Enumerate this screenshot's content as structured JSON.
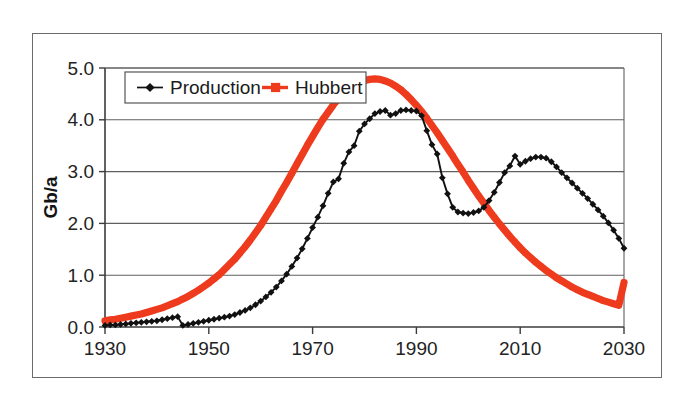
{
  "figure": {
    "has_outer_frame": true,
    "frame_color": "#6b6b6b",
    "background": "#ffffff"
  },
  "chart_data": {
    "type": "line",
    "title": "",
    "subtitle": "",
    "xlabel": "",
    "ylabel": "Gb/a",
    "xlim": [
      1930,
      2030
    ],
    "ylim": [
      0.0,
      5.0
    ],
    "xticks": [
      1930,
      1950,
      1970,
      1990,
      2010,
      2030
    ],
    "xtick_labels": [
      "1930",
      "1950",
      "1970",
      "1990",
      "2010",
      "2030"
    ],
    "yticks": [
      0.0,
      1.0,
      2.0,
      3.0,
      4.0,
      5.0
    ],
    "ytick_labels": [
      "0.0",
      "1.0",
      "2.0",
      "3.0",
      "4.0",
      "5.0"
    ],
    "grid": "horizontal",
    "legend_position": "top-left-inside",
    "x": [
      1930,
      1931,
      1932,
      1933,
      1934,
      1935,
      1936,
      1937,
      1938,
      1939,
      1940,
      1941,
      1942,
      1943,
      1944,
      1945,
      1946,
      1947,
      1948,
      1949,
      1950,
      1951,
      1952,
      1953,
      1954,
      1955,
      1956,
      1957,
      1958,
      1959,
      1960,
      1961,
      1962,
      1963,
      1964,
      1965,
      1966,
      1967,
      1968,
      1969,
      1970,
      1971,
      1972,
      1973,
      1974,
      1975,
      1976,
      1977,
      1978,
      1979,
      1980,
      1981,
      1982,
      1983,
      1984,
      1985,
      1986,
      1987,
      1988,
      1989,
      1990,
      1991,
      1992,
      1993,
      1994,
      1995,
      1996,
      1997,
      1998,
      1999,
      2000,
      2001,
      2002,
      2003,
      2004,
      2005,
      2006,
      2007,
      2008,
      2009,
      2010,
      2011,
      2012,
      2013,
      2014,
      2015,
      2016,
      2017,
      2018,
      2019,
      2020,
      2021,
      2022,
      2023,
      2024,
      2025,
      2026,
      2027,
      2028,
      2029,
      2030
    ],
    "series": [
      {
        "name": "Production",
        "color": "#111111",
        "marker": "diamond",
        "marker_size": 3.4,
        "line_width": 1.9,
        "values": [
          0.03,
          0.04,
          0.04,
          0.05,
          0.06,
          0.07,
          0.08,
          0.09,
          0.1,
          0.11,
          0.12,
          0.14,
          0.16,
          0.18,
          0.2,
          0.03,
          0.05,
          0.07,
          0.09,
          0.11,
          0.13,
          0.15,
          0.17,
          0.19,
          0.21,
          0.24,
          0.28,
          0.32,
          0.37,
          0.43,
          0.5,
          0.58,
          0.67,
          0.77,
          0.89,
          1.02,
          1.17,
          1.33,
          1.51,
          1.71,
          1.92,
          2.12,
          2.34,
          2.58,
          2.8,
          2.86,
          3.16,
          3.38,
          3.5,
          3.78,
          3.92,
          4.02,
          4.12,
          4.16,
          4.18,
          4.09,
          4.12,
          4.18,
          4.19,
          4.18,
          4.17,
          4.08,
          3.79,
          3.52,
          3.34,
          2.88,
          2.57,
          2.31,
          2.22,
          2.2,
          2.19,
          2.21,
          2.24,
          2.31,
          2.44,
          2.6,
          2.79,
          2.98,
          3.11,
          3.3,
          3.14,
          3.2,
          3.25,
          3.28,
          3.28,
          3.26,
          3.19,
          3.09,
          2.98,
          2.88,
          2.78,
          2.68,
          2.58,
          2.48,
          2.37,
          2.26,
          2.14,
          2.01,
          1.87,
          1.71,
          1.52
        ]
      },
      {
        "name": "Hubbert",
        "color": "#ee3b1e",
        "marker": "square",
        "marker_size": 5.2,
        "line_width": 7.2,
        "values": [
          0.12,
          0.14,
          0.15,
          0.17,
          0.19,
          0.21,
          0.23,
          0.25,
          0.28,
          0.31,
          0.34,
          0.37,
          0.41,
          0.45,
          0.49,
          0.54,
          0.59,
          0.65,
          0.71,
          0.78,
          0.85,
          0.93,
          1.01,
          1.11,
          1.21,
          1.31,
          1.43,
          1.55,
          1.68,
          1.82,
          1.96,
          2.12,
          2.28,
          2.44,
          2.62,
          2.79,
          2.97,
          3.15,
          3.33,
          3.51,
          3.68,
          3.85,
          4.01,
          4.15,
          4.29,
          4.41,
          4.51,
          4.6,
          4.67,
          4.73,
          4.76,
          4.78,
          4.79,
          4.78,
          4.75,
          4.71,
          4.65,
          4.58,
          4.49,
          4.39,
          4.28,
          4.16,
          4.03,
          3.89,
          3.75,
          3.6,
          3.45,
          3.3,
          3.14,
          2.99,
          2.83,
          2.68,
          2.53,
          2.39,
          2.25,
          2.12,
          1.99,
          1.87,
          1.75,
          1.64,
          1.53,
          1.43,
          1.34,
          1.25,
          1.17,
          1.09,
          1.02,
          0.95,
          0.89,
          0.83,
          0.77,
          0.72,
          0.67,
          0.63,
          0.59,
          0.55,
          0.51,
          0.48,
          0.45,
          0.42,
          0.86
        ]
      }
    ],
    "annotations": []
  },
  "legend": {
    "entries": [
      {
        "label": "Production",
        "color": "#111111",
        "marker": "diamond"
      },
      {
        "label": "Hubbert",
        "color": "#ee3b1e",
        "marker": "square"
      }
    ]
  }
}
